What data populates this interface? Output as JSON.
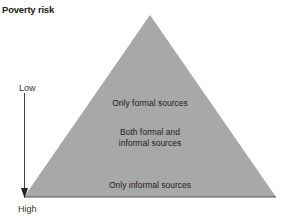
{
  "title": "Poverty risk",
  "axis": {
    "top_label": "Low",
    "bottom_label": "High",
    "direction": "down-arrow"
  },
  "pyramid": {
    "fill_color": "#a8a8a8",
    "base_line_color": "#555555",
    "levels": [
      {
        "label_line1": "Only formal sources",
        "label_line2": ""
      },
      {
        "label_line1": "Both formal and",
        "label_line2": "informal sources"
      },
      {
        "label_line1": "Only informal sources",
        "label_line2": ""
      }
    ]
  }
}
